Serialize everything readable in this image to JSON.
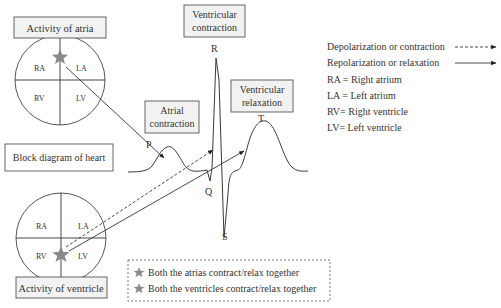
{
  "diagram": {
    "title_boxes": {
      "activity_of_atria": "Activity of atria",
      "activity_of_ventricle": "Activity of ventricle",
      "block_diagram": "Block diagram of heart",
      "ventricular_contraction_line1": "Ventricular",
      "ventricular_contraction_line2": "contraction",
      "atrial_contraction_line1": "Atrial",
      "atrial_contraction_line2": "contraction",
      "ventricular_relaxation_line1": "Ventricular",
      "ventricular_relaxation_line2": "relaxation"
    },
    "heart_chambers": {
      "top": {
        "ra": "RA",
        "la": "LA",
        "rv": "RV",
        "lv": "LV"
      },
      "bottom": {
        "ra": "RA",
        "la": "LA",
        "rv": "RV",
        "lv": "LV"
      }
    },
    "ecg_waves": {
      "p": "P",
      "q": "Q",
      "r": "R",
      "s": "S",
      "t": "T"
    },
    "legend": {
      "depolarization": "Depolarization or contraction",
      "repolarization": "Repolarization or relaxation",
      "ra": "RA = Right atrium",
      "la": "LA = Left atrium",
      "rv": "RV= Right ventricle",
      "lv": "LV= Left ventricle"
    },
    "star_notes": {
      "atria": "Both the atrias contract/relax together",
      "ventricles": "Both the ventricles contract/relax together"
    },
    "colors": {
      "star": "#8a8a8a",
      "box_fill": "#f2f2f2",
      "stroke": "#444444"
    }
  }
}
